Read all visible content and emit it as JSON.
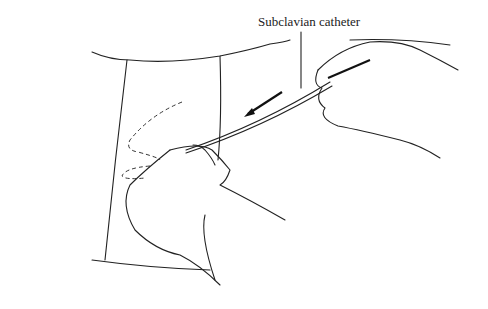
{
  "figure": {
    "type": "medical-illustration",
    "label": "Subclavian catheter",
    "elements": [
      "drape",
      "left-hand",
      "right-hand",
      "catheter",
      "direction-arrow",
      "dashed-outline"
    ]
  }
}
